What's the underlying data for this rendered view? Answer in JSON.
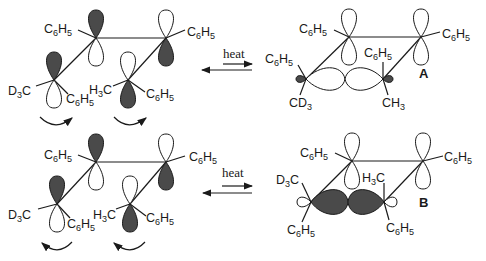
{
  "diagram": {
    "type": "orbital-rearrangement-scheme",
    "rows": [
      {
        "id": "top",
        "reactant": {
          "substituents": [
            "C6H5",
            "C6H5",
            "D3C",
            "C6H5",
            "H3C",
            "C6H5"
          ],
          "rotation_arrows": [
            "clockwise",
            "clockwise"
          ]
        },
        "arrow_label": "heat",
        "product": {
          "label": "A",
          "substituents": [
            "C6H5",
            "C6H5",
            "C6H5",
            "CD3",
            "C6H5",
            "CH3"
          ]
        }
      },
      {
        "id": "bottom",
        "reactant": {
          "substituents": [
            "C6H5",
            "C6H5",
            "D3C",
            "C6H5",
            "H3C",
            "C6H5"
          ],
          "rotation_arrows": [
            "counterclockwise",
            "counterclockwise"
          ]
        },
        "arrow_label": "heat",
        "product": {
          "label": "B",
          "substituents": [
            "C6H5",
            "C6H5",
            "D3C",
            "C6H5",
            "H3C",
            "C6H5"
          ]
        }
      }
    ]
  },
  "labels": {
    "ph": "C",
    "ph6": "6",
    "phH": "H",
    "ph5": "5",
    "heat": "heat",
    "A": "A",
    "B": "B",
    "d3c_a": "D",
    "d3c_3": "3",
    "d3c_c": "C",
    "h3c_h": "H",
    "h3c_3": "3",
    "h3c_c": "C",
    "cd3_c": "CD",
    "cd3_3": "3",
    "ch3_c": "CH",
    "ch3_3": "3"
  }
}
